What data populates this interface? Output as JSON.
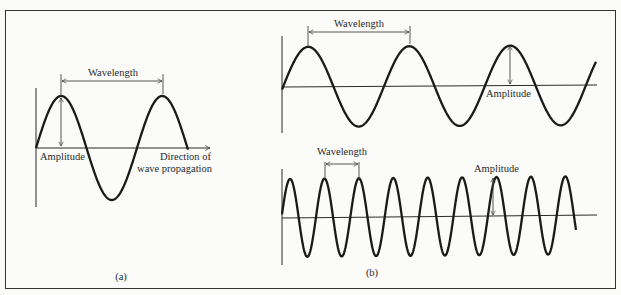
{
  "figure": {
    "panel_a": {
      "wavelength_label": "Wavelength",
      "amplitude_label": "Amplitude",
      "direction_label_line1": "Direction of",
      "direction_label_line2": "wave propagation",
      "caption": "(a)"
    },
    "panel_b": {
      "top": {
        "wavelength_label": "Wavelength",
        "amplitude_label": "Amplitude"
      },
      "bottom": {
        "wavelength_label": "Wavelength",
        "amplitude_label": "Amplitude"
      },
      "caption": "(b)"
    },
    "colors": {
      "stroke": "#1a1a1a",
      "background": "#fbfbf9",
      "border": "#333333"
    }
  }
}
